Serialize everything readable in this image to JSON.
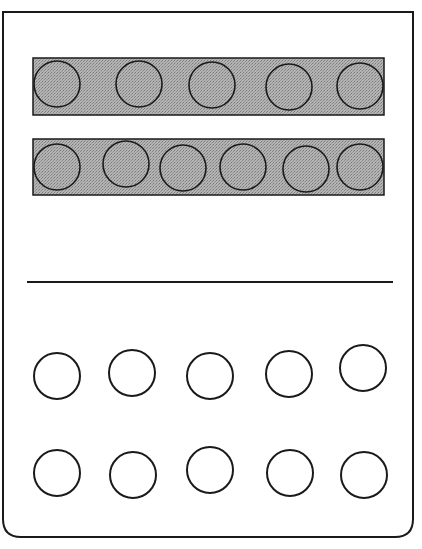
{
  "figure": {
    "frame": {
      "x": 3,
      "y": 12,
      "width": 410,
      "height": 525,
      "corner_radius": 18
    },
    "colors": {
      "stroke": "#1a1a1a",
      "bar_fill": "#a8a8a8",
      "background": "#ffffff"
    },
    "circle_radius": 23,
    "bars": [
      {
        "x": 33,
        "y": 58,
        "width": 351,
        "height": 57,
        "circles": [
          [
            57,
            84
          ],
          [
            139,
            84
          ],
          [
            212,
            85
          ],
          [
            289,
            87
          ],
          [
            360,
            86
          ]
        ]
      },
      {
        "x": 33,
        "y": 139,
        "width": 351,
        "height": 56,
        "circles": [
          [
            57,
            167
          ],
          [
            126,
            164
          ],
          [
            183,
            168
          ],
          [
            243,
            167
          ],
          [
            306,
            169
          ],
          [
            360,
            167
          ]
        ]
      }
    ],
    "divider": {
      "x1": 27,
      "x2": 393,
      "y": 282
    },
    "open_rows": [
      {
        "circles": [
          [
            57,
            376
          ],
          [
            132,
            373
          ],
          [
            210,
            376
          ],
          [
            289,
            374
          ],
          [
            363,
            368
          ]
        ]
      },
      {
        "circles": [
          [
            57,
            473
          ],
          [
            133,
            475
          ],
          [
            210,
            470
          ],
          [
            290,
            473
          ],
          [
            364,
            475
          ]
        ]
      }
    ]
  }
}
